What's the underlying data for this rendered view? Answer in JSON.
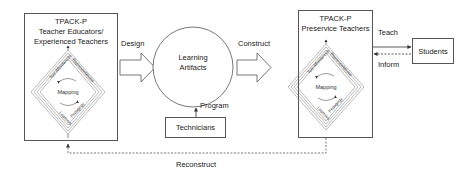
{
  "diagram": {
    "left_box": {
      "line1": "TPACK-P",
      "line2": "Teacher Educators/",
      "line3": "Experienced Teachers"
    },
    "right_box": {
      "line1": "TPACK-P",
      "line2": "Preservice Teachers"
    },
    "diamond_labels": {
      "upper_left": "Tool Affordances",
      "upper_right": "Representations",
      "lower_left": "Learners",
      "lower_right": "Pedagogy",
      "center": "Mapping"
    },
    "circle": {
      "line1": "Learning",
      "line2": "Artifacts"
    },
    "technicians": "Technicians",
    "students": "Students",
    "edges": {
      "design": "Design",
      "construct": "Construct",
      "program": "Program",
      "teach": "Teach",
      "inform": "Inform",
      "reconstruct": "Reconstruct"
    },
    "colors": {
      "stroke": "#555555",
      "text": "#222222",
      "background": "#ffffff"
    }
  }
}
